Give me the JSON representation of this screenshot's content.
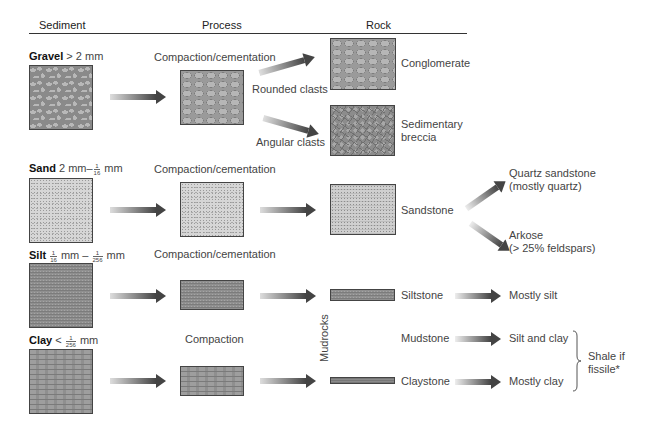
{
  "headers": {
    "sediment": "Sediment",
    "process": "Process",
    "rock": "Rock"
  },
  "rows": {
    "gravel": {
      "name": "Gravel",
      "size": "> 2 mm",
      "process": "Compaction/cementation",
      "branch_rounded": "Rounded clasts",
      "branch_angular": "Angular clasts",
      "rock_rounded": "Conglomerate",
      "rock_angular_line1": "Sedimentary",
      "rock_angular_line2": "breccia"
    },
    "sand": {
      "name": "Sand",
      "size_prefix": "2 mm–",
      "size_frac_num": "1",
      "size_frac_den": "16",
      "size_suffix": "mm",
      "process": "Compaction/cementation",
      "rock": "Sandstone",
      "variant1_line1": "Quartz sandstone",
      "variant1_line2": "(mostly quartz)",
      "variant2_line1": "Arkose",
      "variant2_line2": "(> 25% feldspars)"
    },
    "silt": {
      "name": "Silt",
      "frac1_num": "1",
      "frac1_den": "16",
      "mid": "mm –",
      "frac2_num": "1",
      "frac2_den": "256",
      "suffix": "mm",
      "process": "Compaction/cementation",
      "rock": "Siltstone",
      "composition": "Mostly silt"
    },
    "clay": {
      "name": "Clay",
      "prefix": "<",
      "frac_num": "1",
      "frac_den": "256",
      "suffix": "mm",
      "process": "Compaction",
      "rock_mud": "Mudstone",
      "composition_mud": "Silt and clay",
      "rock": "Claystone",
      "composition": "Mostly clay"
    }
  },
  "group_label": "Mudrocks",
  "shale_note_line1": "Shale if",
  "shale_note_line2": "fissile*"
}
